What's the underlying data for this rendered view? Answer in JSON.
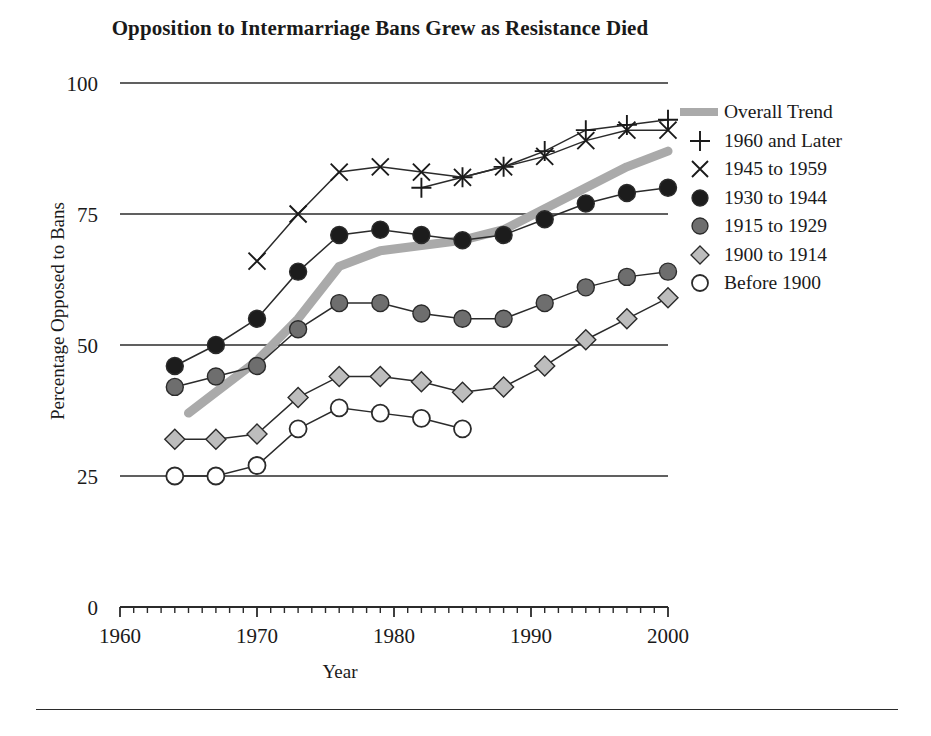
{
  "title": "Opposition to Intermarriage Bans Grew as Resistance Died",
  "axes": {
    "xlabel": "Year",
    "ylabel": "Percentage Opposed to Bans",
    "ytick_labels": [
      "0",
      "25",
      "50",
      "75",
      "100"
    ],
    "xtick_labels": [
      "1960",
      "1970",
      "1980",
      "1990",
      "2000"
    ]
  },
  "legend": {
    "items": [
      {
        "label": "Overall Trend",
        "marker": "thick-gray-line-icon",
        "color": "#aaaaaa"
      },
      {
        "label": "1960 and Later",
        "marker": "plus-icon",
        "color": "#1a1a1a"
      },
      {
        "label": "1945 to 1959",
        "marker": "cross-icon",
        "color": "#1a1a1a"
      },
      {
        "label": "1930 to 1944",
        "marker": "filled-black-circle-icon",
        "color": "#1c1c1c"
      },
      {
        "label": "1915 to 1929",
        "marker": "gray-circle-icon",
        "color": "#6e6e6e"
      },
      {
        "label": "1900 to 1914",
        "marker": "light-gray-diamond-icon",
        "color": "#bdbdbd"
      },
      {
        "label": "Before 1900",
        "marker": "open-circle-icon",
        "color": "#ffffff"
      }
    ]
  },
  "chart_data": {
    "type": "line",
    "title": "Opposition to Intermarriage Bans Grew as Resistance Died",
    "xlabel": "Year",
    "ylabel": "Percentage Opposed to Bans",
    "xlim": [
      1960,
      2000
    ],
    "ylim": [
      0,
      100
    ],
    "yticks": [
      0,
      25,
      50,
      75,
      100
    ],
    "xticks": [
      1960,
      1970,
      1980,
      1990,
      2000
    ],
    "minor_xtick_interval": 1,
    "grid": "horizontal-gridlines-at-yticks",
    "legend_position": "right",
    "series": [
      {
        "name": "Overall Trend",
        "marker": "none",
        "style": "thick-gray-band",
        "color": "#aaaaaa",
        "x": [
          1965,
          1967,
          1970,
          1973,
          1976,
          1979,
          1982,
          1985,
          1988,
          1991,
          1994,
          1997,
          2000
        ],
        "y": [
          37,
          41,
          47,
          55,
          65,
          68,
          69,
          70,
          72,
          76,
          80,
          84,
          87
        ]
      },
      {
        "name": "1960 and Later",
        "marker": "plus",
        "color": "#1a1a1a",
        "x": [
          1982,
          1985,
          1988,
          1991,
          1994,
          1997,
          2000
        ],
        "y": [
          80,
          82,
          84,
          87,
          91,
          92,
          93
        ]
      },
      {
        "name": "1945 to 1959",
        "marker": "cross",
        "color": "#1a1a1a",
        "x": [
          1970,
          1973,
          1976,
          1979,
          1982,
          1985,
          1988,
          1991,
          1994,
          1997,
          2000
        ],
        "y": [
          66,
          75,
          83,
          84,
          83,
          82,
          84,
          86,
          89,
          91,
          91
        ]
      },
      {
        "name": "1930 to 1944",
        "marker": "filled-circle",
        "color": "#1c1c1c",
        "x": [
          1964,
          1967,
          1970,
          1973,
          1976,
          1979,
          1982,
          1985,
          1988,
          1991,
          1994,
          1997,
          2000
        ],
        "y": [
          46,
          50,
          55,
          64,
          71,
          72,
          71,
          70,
          71,
          74,
          77,
          79,
          80
        ]
      },
      {
        "name": "1915 to 1929",
        "marker": "gray-circle",
        "color": "#6e6e6e",
        "x": [
          1964,
          1967,
          1970,
          1973,
          1976,
          1979,
          1982,
          1985,
          1988,
          1991,
          1994,
          1997,
          2000
        ],
        "y": [
          42,
          44,
          46,
          53,
          58,
          58,
          56,
          55,
          55,
          58,
          61,
          63,
          64
        ]
      },
      {
        "name": "1900 to 1914",
        "marker": "diamond",
        "color": "#bdbdbd",
        "x": [
          1964,
          1967,
          1970,
          1973,
          1976,
          1979,
          1982,
          1985,
          1988,
          1991,
          1994,
          1997,
          2000
        ],
        "y": [
          32,
          32,
          33,
          40,
          44,
          44,
          43,
          41,
          42,
          46,
          51,
          55,
          59
        ]
      },
      {
        "name": "Before 1900",
        "marker": "open-circle",
        "color": "#ffffff",
        "x": [
          1964,
          1967,
          1970,
          1973,
          1976,
          1979,
          1982,
          1985
        ],
        "y": [
          25,
          25,
          27,
          34,
          38,
          37,
          36,
          34
        ]
      }
    ]
  }
}
